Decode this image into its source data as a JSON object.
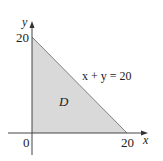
{
  "diagram": {
    "region_label": "D",
    "line_label": "x + y = 20",
    "axes": {
      "x_label": "x",
      "y_label": "y",
      "origin_label": "0",
      "x_tick_label": "20",
      "y_tick_label": "20"
    },
    "colors": {
      "fill": "#d9d9d9",
      "axis": "#444444",
      "edge": "#555555"
    }
  }
}
